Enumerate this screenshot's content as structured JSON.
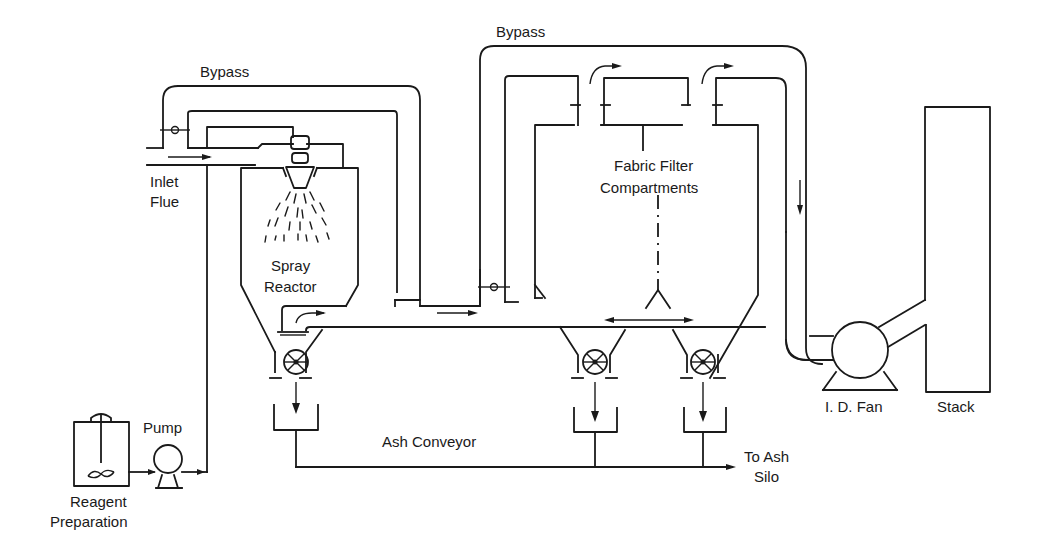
{
  "diagram": {
    "labels": {
      "bypass_left": "Bypass",
      "bypass_right": "Bypass",
      "inlet_flue_line1": "Inlet",
      "inlet_flue_line2": "Flue",
      "spray_reactor_line1": "Spray",
      "spray_reactor_line2": "Reactor",
      "fabric_filter_line1": "Fabric Filter",
      "fabric_filter_line2": "Compartments",
      "ash_conveyor": "Ash Conveyor",
      "to_ash_silo_line1": "To Ash",
      "to_ash_silo_line2": "Silo",
      "pump": "Pump",
      "reagent_line1": "Reagent",
      "reagent_line2": "Preparation",
      "id_fan": "I. D. Fan",
      "stack": "Stack"
    },
    "components": [
      {
        "id": "reagent-tank",
        "label": "Reagent Preparation"
      },
      {
        "id": "pump",
        "label": "Pump"
      },
      {
        "id": "spray-reactor",
        "label": "Spray Reactor"
      },
      {
        "id": "fabric-filter",
        "label": "Fabric Filter Compartments"
      },
      {
        "id": "id-fan",
        "label": "I. D. Fan"
      },
      {
        "id": "stack",
        "label": "Stack"
      },
      {
        "id": "ash-conveyor",
        "label": "Ash Conveyor"
      },
      {
        "id": "ash-silo",
        "label": "To Ash Silo"
      }
    ],
    "colors": {
      "line": "#1a1a1a",
      "background": "#ffffff"
    }
  }
}
